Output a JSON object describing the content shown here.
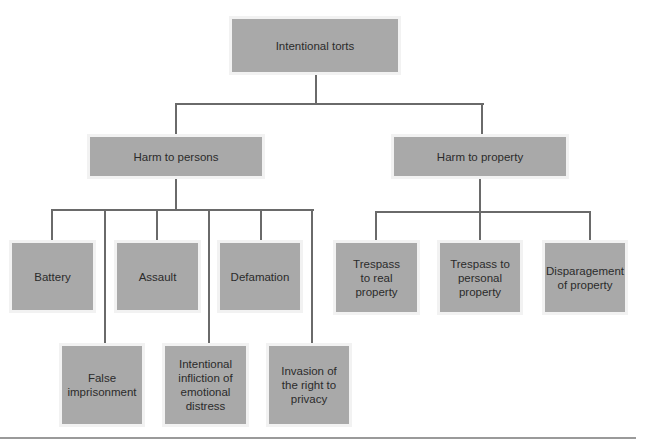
{
  "diagram": {
    "type": "tree",
    "root": {
      "label": "Intentional torts"
    },
    "branches": [
      {
        "label": "Harm to persons",
        "children": [
          {
            "label": "Battery"
          },
          {
            "label": "Assault"
          },
          {
            "label": "Defamation"
          },
          {
            "label": "False\nimprisonment"
          },
          {
            "label": "Intentional\ninfliction of\nemotional\ndistress"
          },
          {
            "label": "Invasion of\nthe right to\nprivacy"
          }
        ]
      },
      {
        "label": "Harm to property",
        "children": [
          {
            "label": "Trespass\nto real\nproperty"
          },
          {
            "label": "Trespass to\npersonal\nproperty"
          },
          {
            "label": "Disparagement\nof property"
          }
        ]
      }
    ],
    "colors": {
      "box_fill": "#a9a9a9",
      "connector": "#6a6a6a",
      "text": "#2b2b2b"
    }
  }
}
